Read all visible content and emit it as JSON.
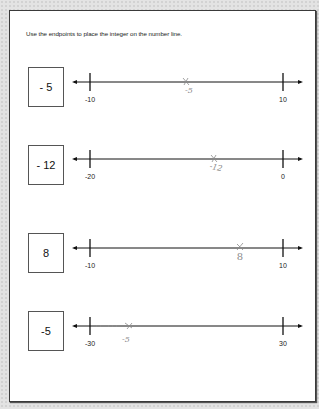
{
  "worksheet": {
    "instruction": "Use the endpoints to place the integer on the number line.",
    "items": [
      {
        "integer": "- 5",
        "left_endpoint": "-10",
        "right_endpoint": "10",
        "student_mark_label": "-5"
      },
      {
        "integer": "- 12",
        "left_endpoint": "-20",
        "right_endpoint": "0",
        "student_mark_label": "-12"
      },
      {
        "integer": "8",
        "left_endpoint": "-10",
        "right_endpoint": "10",
        "student_mark_label": "8"
      },
      {
        "integer": "-5",
        "left_endpoint": "-30",
        "right_endpoint": "30",
        "student_mark_label": "-5"
      }
    ]
  },
  "colors": {
    "background": "#e3e3e3",
    "page": "#ffffff",
    "ink": "#111111",
    "pencil": "#8a8a8a"
  }
}
